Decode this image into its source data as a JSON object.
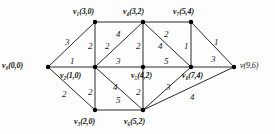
{
  "figure": {
    "kind": "weighted-undirected-graph",
    "width": 275,
    "height": 134,
    "background_color": "#fdfdfd",
    "edge_color": "#2b2b2b",
    "vertex_color": "#000000",
    "label_color": "#111111"
  },
  "vertices": [
    {
      "id": "v0",
      "name": "v",
      "subscript": "0",
      "coords": "(0,0)",
      "label": "v₀(0,0)",
      "x": 48,
      "y": 67,
      "label_x": 2,
      "label_y": 62,
      "label_align": "left"
    },
    {
      "id": "v1",
      "name": "v",
      "subscript": "1",
      "coords": "(3,0)",
      "label": "v₁(3,0)",
      "x": 95,
      "y": 22,
      "label_x": 73,
      "label_y": 8,
      "label_align": "left"
    },
    {
      "id": "v2",
      "name": "v",
      "subscript": "2",
      "coords": "(1,0)",
      "label": "v₂(1,0)",
      "x": 95,
      "y": 67,
      "label_x": 60,
      "label_y": 72,
      "label_align": "left"
    },
    {
      "id": "v3",
      "name": "v",
      "subscript": "3",
      "coords": "(2,0)",
      "label": "v₃(2,0)",
      "x": 95,
      "y": 110,
      "label_x": 74,
      "label_y": 118,
      "label_align": "left"
    },
    {
      "id": "v4",
      "name": "v",
      "subscript": "4",
      "coords": "(3,2)",
      "label": "v₄(3,2)",
      "x": 143,
      "y": 22,
      "label_x": 123,
      "label_y": 8,
      "label_align": "left"
    },
    {
      "id": "v5",
      "name": "v",
      "subscript": "5",
      "coords": "(4,2)",
      "label": "v₅(4,2)",
      "x": 143,
      "y": 67,
      "label_x": 131,
      "label_y": 72,
      "label_align": "left"
    },
    {
      "id": "v6",
      "name": "v",
      "subscript": "6",
      "coords": "(5,2)",
      "label": "v₆(5,2)",
      "x": 143,
      "y": 110,
      "label_x": 124,
      "label_y": 118,
      "label_align": "left"
    },
    {
      "id": "v7",
      "name": "v",
      "subscript": "7",
      "coords": "(5,4)",
      "label": "v₇(5,4)",
      "x": 191,
      "y": 22,
      "label_x": 173,
      "label_y": 8,
      "label_align": "left"
    },
    {
      "id": "v8",
      "name": "v",
      "subscript": "8",
      "coords": "(7,4)",
      "label": "v₈(7,4)",
      "x": 191,
      "y": 67,
      "label_x": 182,
      "label_y": 72,
      "label_align": "left"
    },
    {
      "id": "v9",
      "name": "v",
      "subscript": "",
      "coords": "(9,6)",
      "label": "v(9,6)",
      "x": 234,
      "y": 67,
      "label_x": 240,
      "label_y": 62,
      "label_align": "left"
    }
  ],
  "edges": [
    {
      "id": "e-v0-v1",
      "from": "v0",
      "to": "v1",
      "weight": "3",
      "wx": 65,
      "wy": 38
    },
    {
      "id": "e-v0-v2",
      "from": "v0",
      "to": "v2",
      "weight": "1",
      "wx": 70,
      "wy": 57
    },
    {
      "id": "e-v0-v3",
      "from": "v0",
      "to": "v3",
      "weight": "2",
      "wx": 62,
      "wy": 90
    },
    {
      "id": "e-v1-v2",
      "from": "v1",
      "to": "v2",
      "weight": "2",
      "wx": 88,
      "wy": 42
    },
    {
      "id": "e-v1-v4",
      "from": "v1",
      "to": "v4",
      "weight": "4",
      "wx": 116,
      "wy": 30
    },
    {
      "id": "e-v2-v4",
      "from": "v2",
      "to": "v4",
      "weight": "2",
      "wx": 105,
      "wy": 42
    },
    {
      "id": "e-v2-v5",
      "from": "v2",
      "to": "v5",
      "weight": "3",
      "wx": 116,
      "wy": 57
    },
    {
      "id": "e-v2-v3",
      "from": "v2",
      "to": "v3",
      "weight": "2",
      "wx": 88,
      "wy": 88
    },
    {
      "id": "e-v2-v6",
      "from": "v2",
      "to": "v6",
      "weight": "4",
      "wx": 113,
      "wy": 83
    },
    {
      "id": "e-v3-v6",
      "from": "v3",
      "to": "v6",
      "weight": "5",
      "wx": 116,
      "wy": 96
    },
    {
      "id": "e-v4-v5",
      "from": "v4",
      "to": "v5",
      "weight": "2",
      "wx": 136,
      "wy": 42
    },
    {
      "id": "e-v4-v7",
      "from": "v4",
      "to": "v7",
      "weight": "2",
      "wx": 164,
      "wy": 30
    },
    {
      "id": "e-v4-v8",
      "from": "v4",
      "to": "v8",
      "weight": "4",
      "wx": 158,
      "wy": 42
    },
    {
      "id": "e-v5-v6",
      "from": "v5",
      "to": "v6",
      "weight": "2",
      "wx": 136,
      "wy": 88
    },
    {
      "id": "e-v5-v8",
      "from": "v5",
      "to": "v8",
      "weight": "5",
      "wx": 164,
      "wy": 57
    },
    {
      "id": "e-v6-v8",
      "from": "v6",
      "to": "v8",
      "weight": "3",
      "wx": 166,
      "wy": 83
    },
    {
      "id": "e-v6-v9",
      "from": "v6",
      "to": "v9",
      "weight": "4",
      "wx": 190,
      "wy": 93
    },
    {
      "id": "e-v7-v8",
      "from": "v7",
      "to": "v8",
      "weight": "1",
      "wx": 184,
      "wy": 42
    },
    {
      "id": "e-v7-v9",
      "from": "v7",
      "to": "v9",
      "weight": "1",
      "wx": 214,
      "wy": 38
    },
    {
      "id": "e-v8-v9",
      "from": "v8",
      "to": "v9",
      "weight": "3",
      "wx": 211,
      "wy": 55
    }
  ]
}
